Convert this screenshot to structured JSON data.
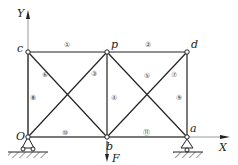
{
  "diagram": {
    "type": "truss",
    "axes": {
      "x_label": "X",
      "y_label": "Y"
    },
    "nodes": [
      {
        "id": "O",
        "label": "O",
        "x": 28,
        "y": 137,
        "lx": 16,
        "ly": 140
      },
      {
        "id": "c",
        "label": "c",
        "x": 28,
        "y": 52,
        "lx": 17,
        "ly": 52
      },
      {
        "id": "p",
        "label": "p",
        "x": 107,
        "y": 52,
        "lx": 111,
        "ly": 48
      },
      {
        "id": "d",
        "label": "d",
        "x": 187,
        "y": 52,
        "lx": 191,
        "ly": 48
      },
      {
        "id": "b",
        "label": "b",
        "x": 107,
        "y": 137,
        "lx": 106,
        "ly": 150
      },
      {
        "id": "a",
        "label": "a",
        "x": 187,
        "y": 137,
        "lx": 190,
        "ly": 132
      }
    ],
    "members": [
      {
        "num": "①",
        "from": "c",
        "to": "p",
        "lx": 67,
        "ly": 47
      },
      {
        "num": "②",
        "from": "p",
        "to": "d",
        "lx": 148,
        "ly": 47
      },
      {
        "num": "③",
        "from": "p",
        "to": "O",
        "lx": 94,
        "ly": 76
      },
      {
        "num": "④",
        "from": "p",
        "to": "b",
        "lx": 114,
        "ly": 100
      },
      {
        "num": "⑤",
        "from": "p",
        "to": "a",
        "lx": 147,
        "ly": 78
      },
      {
        "num": "⑥",
        "from": "c",
        "to": "b",
        "lx": 45,
        "ly": 77
      },
      {
        "num": "⑦",
        "from": "d",
        "to": "b",
        "lx": 174,
        "ly": 77
      },
      {
        "num": "⑧",
        "from": "c",
        "to": "O",
        "lx": 33,
        "ly": 100
      },
      {
        "num": "⑨",
        "from": "d",
        "to": "a",
        "lx": 179,
        "ly": 100
      },
      {
        "num": "⑩",
        "from": "O",
        "to": "b",
        "lx": 65,
        "ly": 135
      },
      {
        "num": "⑪",
        "from": "b",
        "to": "a",
        "lx": 146,
        "ly": 135
      }
    ],
    "load": {
      "label": "F",
      "at": "b"
    },
    "supports": [
      {
        "at": "O",
        "type": "pin"
      },
      {
        "at": "a",
        "type": "roller"
      }
    ]
  }
}
